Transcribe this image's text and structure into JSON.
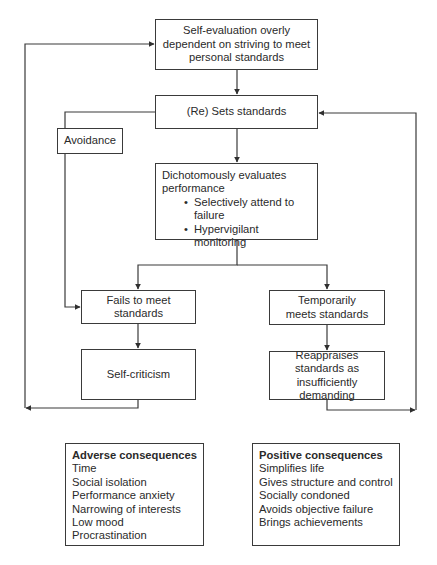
{
  "diagram": {
    "nodes": {
      "self_evaluation": {
        "text": "Self-evaluation overly dependent on striving to meet personal standards"
      },
      "sets_standards": {
        "text": "(Re) Sets standards"
      },
      "avoidance": {
        "text": "Avoidance"
      },
      "evaluates": {
        "title_line1": "Dichotomously evaluates",
        "title_line2": "performance",
        "bullets": [
          "Selectively attend to failure",
          "Hypervigilant monitoring"
        ]
      },
      "fails": {
        "text": "Fails to meet standards"
      },
      "meets": {
        "text": "Temporarily meets standards"
      },
      "self_criticism": {
        "text": "Self-criticism"
      },
      "reappraises": {
        "text": "Reappraises standards as insufficiently demanding"
      }
    },
    "adverse": {
      "heading": "Adverse consequences",
      "items": [
        "Time",
        "Social isolation",
        "Performance anxiety",
        "Narrowing of interests",
        "Low mood",
        "Procrastination"
      ]
    },
    "positive": {
      "heading": "Positive consequences",
      "items": [
        "Simplifies life",
        "Gives structure and control",
        "Socially condoned",
        "Avoids objective failure",
        "Brings achievements"
      ]
    },
    "edges": [
      {
        "from": "self_evaluation",
        "to": "sets_standards"
      },
      {
        "from": "sets_standards",
        "to": "evaluates"
      },
      {
        "from": "sets_standards",
        "to": "fails",
        "via": "avoidance"
      },
      {
        "from": "evaluates",
        "to": "fails"
      },
      {
        "from": "evaluates",
        "to": "meets"
      },
      {
        "from": "fails",
        "to": "self_criticism"
      },
      {
        "from": "meets",
        "to": "reappraises"
      },
      {
        "from": "self_criticism",
        "to": "self_evaluation"
      },
      {
        "from": "reappraises",
        "to": "sets_standards"
      }
    ],
    "colors": {
      "line": "#3a3a3a",
      "background": "#ffffff",
      "text": "#2a2a2a"
    }
  }
}
